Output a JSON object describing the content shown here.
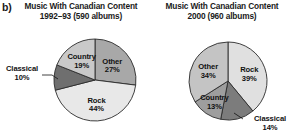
{
  "figure": {
    "part_label": "b)"
  },
  "chart_data": [
    {
      "type": "pie",
      "title": "Music With Canadian Content",
      "subtitle": "1992–93 (590 albums)",
      "categories": [
        "Other",
        "Rock",
        "Classical",
        "Country"
      ],
      "values": [
        27,
        44,
        10,
        19
      ],
      "value_labels": [
        "27%",
        "44%",
        "10%",
        "19%"
      ],
      "colors": [
        "#a8a8a8",
        "#e8e8e8",
        "#6f6f6f",
        "#c9c9c9"
      ],
      "label_placement": [
        "inside",
        "inside",
        "outside",
        "inside"
      ],
      "units": "percent",
      "legend": "none",
      "grid": false
    },
    {
      "type": "pie",
      "title": "Music With Canadian Content",
      "subtitle": "2000 (960 albums)",
      "categories": [
        "Rock",
        "Classical",
        "Country",
        "Other"
      ],
      "values": [
        39,
        14,
        13,
        34
      ],
      "value_labels": [
        "39%",
        "14%",
        "13%",
        "34%"
      ],
      "colors": [
        "#e0e0e0",
        "#7c7c7c",
        "#9e9e9e",
        "#c4c4c4"
      ],
      "label_placement": [
        "inside",
        "outside",
        "inside",
        "inside"
      ],
      "units": "percent",
      "legend": "none",
      "grid": false
    }
  ]
}
